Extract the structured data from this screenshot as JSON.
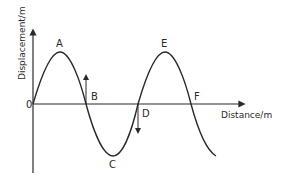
{
  "diagram": {
    "type": "transverse-wave-displacement-distance",
    "y_axis_label": "Displacement/m",
    "x_axis_label": "Distance/m",
    "origin_label": "0",
    "points": [
      {
        "label": "A",
        "role": "crest"
      },
      {
        "label": "B",
        "role": "zero-crossing",
        "arrow": "up"
      },
      {
        "label": "C",
        "role": "trough"
      },
      {
        "label": "D",
        "role": "zero-crossing",
        "arrow": "down"
      },
      {
        "label": "E",
        "role": "crest"
      },
      {
        "label": "F",
        "role": "zero-crossing"
      }
    ]
  },
  "colors": {
    "line": "#2a2a2a",
    "background": "#ffffff"
  }
}
